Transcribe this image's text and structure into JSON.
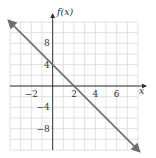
{
  "chart_data": {
    "type": "line",
    "title": "",
    "xlabel": "x",
    "ylabel": "f(x)",
    "xlim": [
      -4,
      8
    ],
    "ylim": [
      -12,
      12
    ],
    "grid": true,
    "x_grid_step": 1,
    "y_grid_step": 2,
    "x_ticks": [
      -2,
      2,
      4,
      6
    ],
    "y_ticks": [
      8,
      4,
      -4,
      -8
    ],
    "x_tick_labels": [
      "−2",
      "2",
      "4",
      "6"
    ],
    "y_tick_labels": [
      "8",
      "4",
      "−4",
      "−8"
    ],
    "series": [
      {
        "name": "f(x) = -2x + 4",
        "x": [
          -4,
          8
        ],
        "y": [
          12,
          -12
        ],
        "arrows_both_ends": true
      }
    ]
  },
  "colors": {
    "grid": "#d9d9d9",
    "axis": "#333333",
    "line": "#6d6d6d"
  }
}
